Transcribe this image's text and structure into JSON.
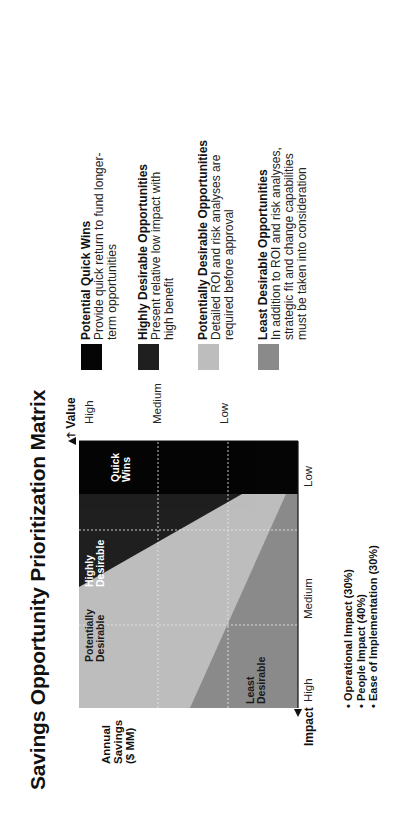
{
  "title": "Savings Opportunity Prioritization Matrix",
  "colors": {
    "quick_wins": "#050505",
    "highly_desirable": "#1f1f1f",
    "potentially_desirable": "#bdbdbd",
    "least_desirable": "#8a8a8a",
    "gridline": "#e8e8e8"
  },
  "axes": {
    "value": {
      "title": "Value",
      "ticks": [
        "High",
        "Medium",
        "Low"
      ]
    },
    "impact": {
      "title": "Impact",
      "ticks": [
        "High",
        "Medium",
        "Low"
      ]
    },
    "y_label_lines": [
      "Annual",
      "Savings",
      "($ MM)"
    ]
  },
  "quadrants": {
    "quick_wins": [
      "Quick",
      "Wins"
    ],
    "highly_desirable": [
      "Highly",
      "Desirable"
    ],
    "potentially_desirable": [
      "Potentially",
      "Desirable"
    ],
    "least_desirable": [
      "Least",
      "Desirable"
    ]
  },
  "criteria": [
    "Operational Impact (30%)",
    "People Impact (40%)",
    "Ease of Implementation (30%)"
  ],
  "legend": [
    {
      "title": "Potential Quick Wins",
      "lines": [
        "Provide quick return to fund longer-",
        "term opportunities"
      ]
    },
    {
      "title": "Highly Desirable Opportunities",
      "lines": [
        "Present relative low impact with",
        "high benefit"
      ]
    },
    {
      "title": "Potentially Desirable Opportunities",
      "lines": [
        "Detailed ROI and risk analyses are",
        "required before approval"
      ]
    },
    {
      "title": "Least Desirable Opportunities",
      "lines": [
        "In addition to ROI and risk analyses,",
        "strategic fit and change capabilities",
        "must be taken into consideration"
      ]
    }
  ]
}
